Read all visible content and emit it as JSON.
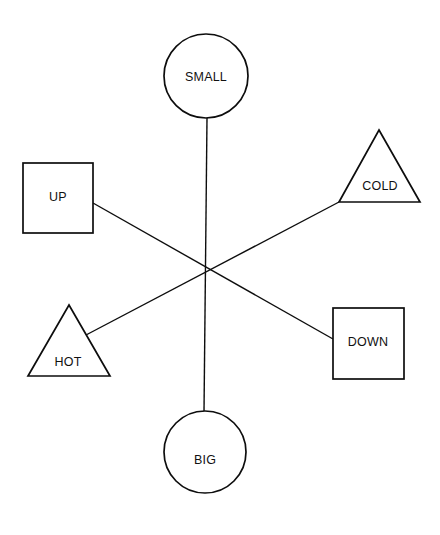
{
  "canvas": {
    "width": 440,
    "height": 535,
    "background": "#ffffff",
    "stroke_color": "#0d0d0d",
    "label_color": "#111111"
  },
  "diagram": {
    "type": "node-link-concept-map",
    "title": "",
    "nodes": [
      {
        "id": "small",
        "label": "SMALL",
        "shape": "circle",
        "cx": 206,
        "cy": 76,
        "r": 42,
        "label_x": 206,
        "label_y": 78
      },
      {
        "id": "up",
        "label": "UP",
        "shape": "square",
        "x": 23,
        "y": 163,
        "width": 70,
        "height": 70,
        "label_x": 58,
        "label_y": 198
      },
      {
        "id": "cold",
        "label": "COLD",
        "shape": "triangle",
        "points": "379,130 420,202 339,202",
        "label_x": 380,
        "label_y": 187
      },
      {
        "id": "hot",
        "label": "HOT",
        "shape": "triangle",
        "points": "69,305 110,376 28,376",
        "label_x": 68,
        "label_y": 363
      },
      {
        "id": "down",
        "label": "DOWN",
        "shape": "square",
        "x": 333,
        "y": 308,
        "width": 71,
        "height": 71,
        "label_x": 368,
        "label_y": 343
      },
      {
        "id": "big",
        "label": "BIG",
        "shape": "circle",
        "cx": 205,
        "cy": 452,
        "r": 41,
        "label_x": 205,
        "label_y": 461
      }
    ],
    "center": {
      "x": 213,
      "y": 273
    },
    "edges": [
      {
        "id": "small-big",
        "from": "small",
        "to": "big",
        "x1": 207,
        "y1": 118,
        "x2": 204,
        "y2": 412
      },
      {
        "id": "up-down",
        "from": "up",
        "to": "down",
        "x1": 93,
        "y1": 203,
        "x2": 333,
        "y2": 339
      },
      {
        "id": "cold-hot",
        "from": "cold",
        "to": "hot",
        "x1": 339,
        "y1": 202,
        "x2": 86,
        "y2": 335
      }
    ]
  }
}
